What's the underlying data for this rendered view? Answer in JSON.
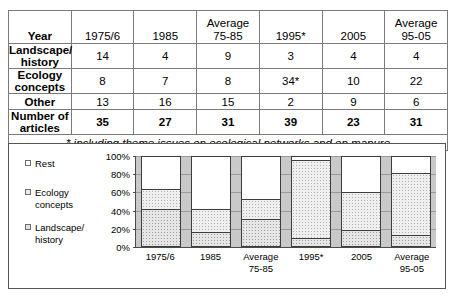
{
  "table": {
    "columns": [
      "Year",
      "1975/6",
      "1985",
      "Average 75-85",
      "1995*",
      "2005",
      "Average 95-05"
    ],
    "header": {
      "rowlabel": "Year",
      "cells": [
        {
          "line1": "1975/6",
          "line2": ""
        },
        {
          "line1": "1985",
          "line2": ""
        },
        {
          "line1": "Average",
          "line2": "75-85"
        },
        {
          "line1": "1995*",
          "line2": ""
        },
        {
          "line1": "2005",
          "line2": ""
        },
        {
          "line1": "Average",
          "line2": "95-05"
        }
      ]
    },
    "rows": [
      {
        "label": "Landscape/ history",
        "values": [
          "14",
          "4",
          "9",
          "3",
          "4",
          "4"
        ],
        "bold": false
      },
      {
        "label": "Ecology concepts",
        "values": [
          "8",
          "7",
          "8",
          "34*",
          "10",
          "22"
        ],
        "bold": false
      },
      {
        "label": "Other",
        "values": [
          "13",
          "16",
          "15",
          "2",
          "9",
          "6"
        ],
        "bold": false
      },
      {
        "label": "Number of articles",
        "values": [
          "35",
          "27",
          "31",
          "39",
          "23",
          "31"
        ],
        "bold": true
      }
    ],
    "footnote": "* including theme issues on ecological networks and on manure"
  },
  "chart_data": {
    "type": "bar",
    "stacked": true,
    "normalized": true,
    "title": "",
    "xlabel": "",
    "ylabel": "",
    "ylim": [
      0,
      100
    ],
    "yticks": [
      "0%",
      "20%",
      "40%",
      "60%",
      "80%",
      "100%"
    ],
    "grid": true,
    "legend_position": "left",
    "categories": [
      "1975/6",
      "1985",
      "Average 75-85",
      "1995*",
      "2005",
      "Average 95-05"
    ],
    "category_labels": [
      {
        "line1": "1975/6",
        "line2": ""
      },
      {
        "line1": "1985",
        "line2": ""
      },
      {
        "line1": "Average",
        "line2": "75-85"
      },
      {
        "line1": "1995*",
        "line2": ""
      },
      {
        "line1": "2005",
        "line2": ""
      },
      {
        "line1": "Average",
        "line2": "95-05"
      }
    ],
    "series": [
      {
        "name": "Landscape/ history",
        "legend_label_line1": "Landscape/",
        "legend_label_line2": "history",
        "values": [
          40,
          15,
          29,
          8,
          17,
          11
        ]
      },
      {
        "name": "Ecology concepts",
        "legend_label_line1": "Ecology",
        "legend_label_line2": "concepts",
        "values": [
          23,
          26,
          23,
          87,
          43,
          70
        ]
      },
      {
        "name": "Rest",
        "legend_label_line1": "Rest",
        "legend_label_line2": "",
        "values": [
          37,
          59,
          48,
          5,
          40,
          19
        ]
      }
    ],
    "legend": [
      {
        "label": "Rest",
        "line1": "Rest",
        "line2": ""
      },
      {
        "label": "Ecology concepts",
        "line1": "Ecology",
        "line2": "concepts"
      },
      {
        "label": "Landscape/ history",
        "line1": "Landscape/",
        "line2": "history"
      }
    ]
  },
  "colors": {
    "border": "#555555",
    "gridline": "#9a9a9a",
    "plot_background": "#c9c9c9",
    "rest_fill": "#ffffff",
    "ecology_fill": "#efefef",
    "landscape_fill": "#e6e6e6"
  }
}
